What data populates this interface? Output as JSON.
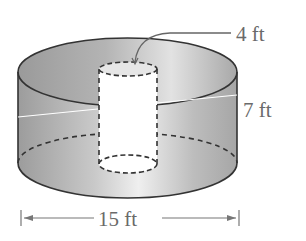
{
  "diagram": {
    "type": "cylinder-with-hole",
    "labels": {
      "hole_diameter": "4 ft",
      "height": "7 ft",
      "outer_diameter": "15 ft"
    },
    "colors": {
      "solid_fill_dark": "#a8a8a8",
      "solid_fill_light": "#ececec",
      "outline": "#333333",
      "label": "#6a6a6a"
    }
  }
}
